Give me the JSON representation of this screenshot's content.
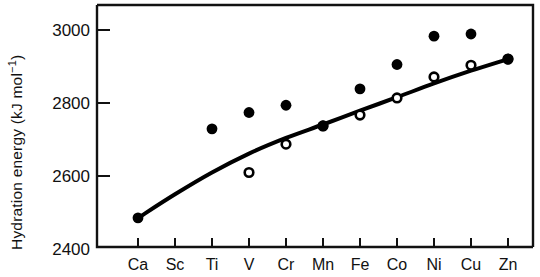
{
  "chart_data": {
    "type": "scatter",
    "title": "",
    "xlabel": "",
    "ylabel": "Hydration energy (kJ mol⁻¹)",
    "ylabel_main": "Hydration energy (kJ mol",
    "ylabel_sup": "−1",
    "ylabel_tail": ")",
    "categories": [
      "Ca",
      "Sc",
      "Ti",
      "V",
      "Cr",
      "Mn",
      "Fe",
      "Co",
      "Ni",
      "Cu",
      "Zn"
    ],
    "xtick_labels": [
      "Ca",
      "Sc",
      "Ti",
      "V",
      "Cr",
      "Mn",
      "Fe",
      "Co",
      "Ni",
      "Cu",
      "Zn"
    ],
    "ytick_labels": [
      "3000",
      "2800",
      "2600",
      "2400"
    ],
    "yticks": [
      3000,
      2800,
      2600,
      2400
    ],
    "ylim": [
      2400,
      3060
    ],
    "xlim": [
      -0.65,
      11.0
    ],
    "grid": false,
    "legend": "none",
    "series": [
      {
        "name": "experimental (filled circles)",
        "marker": "filled-circle",
        "color": "#000000",
        "x": [
          "Ca",
          "Ti",
          "V",
          "Cr",
          "Mn",
          "Fe",
          "Co",
          "Ni",
          "Cu",
          "Zn"
        ],
        "values": [
          2480,
          2725,
          2770,
          2790,
          2733,
          2835,
          2902,
          2980,
          2986,
          2917
        ]
      },
      {
        "name": "corrected / baseline (open circles)",
        "marker": "open-circle",
        "color": "#000000",
        "x": [
          "V",
          "Cr",
          "Mn",
          "Fe",
          "Co",
          "Ni",
          "Cu",
          "Zn"
        ],
        "values": [
          2605,
          2683,
          2733,
          2763,
          2810,
          2868,
          2900,
          2917
        ]
      },
      {
        "name": "smooth trend line",
        "marker": "line",
        "color": "#000000",
        "x": [
          "Ca",
          "Sc",
          "Ti",
          "V",
          "Cr",
          "Mn",
          "Fe",
          "Co",
          "Ni",
          "Cu",
          "Zn"
        ],
        "values": [
          2480,
          2545,
          2605,
          2657,
          2700,
          2737,
          2775,
          2812,
          2850,
          2885,
          2917
        ]
      }
    ]
  },
  "figure": {
    "background_color": "#ffffff",
    "axis_color": "#111111"
  }
}
